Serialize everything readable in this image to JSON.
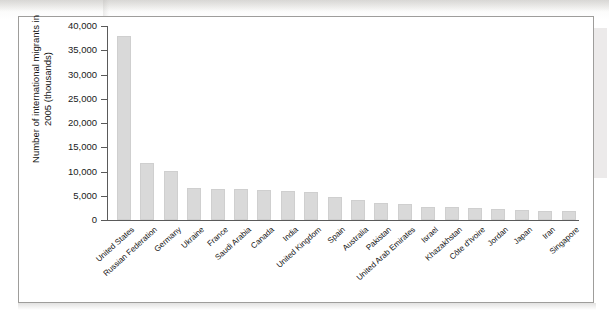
{
  "figure": {
    "title": "",
    "background_color": "#ffffff",
    "border_color": "#9e9d9b",
    "bar_color": "#d9d9d9",
    "axis_color": "#5a5a5a"
  },
  "chart_data": {
    "type": "bar",
    "title": "",
    "xlabel": "",
    "ylabel": "Number of international migrants in 2005 (thousands)",
    "ylim": [
      0,
      40000
    ],
    "grid": false,
    "legend": "none",
    "ytick_labels": [
      "40,000",
      "35,000",
      "30,000",
      "25,000",
      "20,000",
      "15,000",
      "10,000",
      "5,000",
      "0"
    ],
    "ytick_values": [
      40000,
      35000,
      30000,
      25000,
      20000,
      15000,
      10000,
      5000,
      0
    ],
    "categories": [
      "United States",
      "Russian Federation",
      "Germany",
      "Ukraine",
      "France",
      "Saudi Arabia",
      "Canada",
      "India",
      "United Kingdom",
      "Spain",
      "Australia",
      "Pakistan",
      "United Arab Emirates",
      "Israel",
      "Khazakhstan",
      "Côte d'Ivoire",
      "Jordan",
      "Japan",
      "Iran",
      "Singapore"
    ],
    "values": [
      38000,
      11700,
      10100,
      6500,
      6400,
      6300,
      6100,
      6000,
      5800,
      4800,
      4100,
      3500,
      3200,
      2700,
      2600,
      2400,
      2300,
      2000,
      1900,
      1800
    ]
  }
}
